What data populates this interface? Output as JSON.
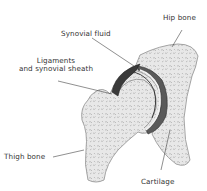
{
  "diagram": {
    "labels": [
      {
        "id": "hip-bone",
        "text": "Hip bone"
      },
      {
        "id": "synovial-fluid",
        "text": "Synovial fluid"
      },
      {
        "id": "ligaments",
        "line1": "Ligaments",
        "line2": "and synovial sheath"
      },
      {
        "id": "thigh-bone",
        "text": "Thigh bone"
      },
      {
        "id": "cartilage",
        "text": "Cartilage"
      }
    ],
    "colors": {
      "bone_fill": "#e6e6e6",
      "bone_edge": "#9a9a9a",
      "trabecular": "#b0b0b0",
      "sheath_dark": "#3a3a3a",
      "cartilage": "#f4f4f4",
      "leader_line": "#444444",
      "text": "#333333"
    }
  }
}
